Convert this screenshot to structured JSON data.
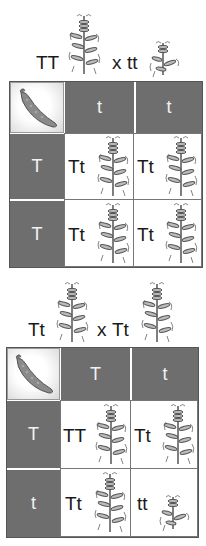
{
  "cross1": {
    "parent1": "TT",
    "operator": "x",
    "parent2": "tt",
    "parent1_plant": "tall-pea-plant-icon",
    "parent2_plant": "short-pea-plant-icon"
  },
  "square1": {
    "corner_icon": "pea-pod-icon",
    "columns": [
      "t",
      "t"
    ],
    "rows": [
      "T",
      "T"
    ],
    "cells": [
      [
        {
          "genotype": "Tt",
          "plant": "tall"
        },
        {
          "genotype": "Tt",
          "plant": "tall"
        }
      ],
      [
        {
          "genotype": "Tt",
          "plant": "tall"
        },
        {
          "genotype": "Tt",
          "plant": "tall"
        }
      ]
    ]
  },
  "cross2": {
    "parent1": "Tt",
    "operator": "x",
    "parent2": "Tt",
    "parent1_plant": "tall-pea-plant-icon",
    "parent2_plant": "tall-pea-plant-icon"
  },
  "square2": {
    "corner_icon": "pea-pod-icon",
    "columns": [
      "T",
      "t"
    ],
    "rows": [
      "T",
      "t"
    ],
    "cells": [
      [
        {
          "genotype": "TT",
          "plant": "tall"
        },
        {
          "genotype": "Tt",
          "plant": "tall"
        }
      ],
      [
        {
          "genotype": "Tt",
          "plant": "tall"
        },
        {
          "genotype": "tt",
          "plant": "short"
        }
      ]
    ]
  },
  "colors": {
    "header_fill": "#6e6e6e",
    "header_text": "#f2f2f2",
    "cell_fill": "#ffffff",
    "plant_stroke": "#555555"
  }
}
